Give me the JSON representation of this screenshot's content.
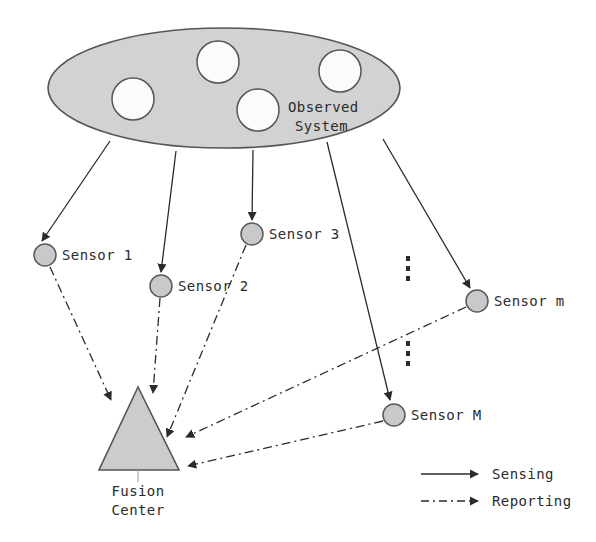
{
  "figure": {
    "title_region": {
      "label_line1": "Observed",
      "label_line2": "System",
      "fill": "#d2d2d2",
      "stroke": "#555555"
    },
    "sensors": [
      {
        "id": "sensor-1",
        "label": "Sensor 1",
        "cx": 45,
        "cy": 255,
        "r": 11,
        "label_x": 62,
        "label_y": 260
      },
      {
        "id": "sensor-2",
        "label": "Sensor 2",
        "cx": 161,
        "cy": 286,
        "r": 11,
        "label_x": 178,
        "label_y": 291
      },
      {
        "id": "sensor-3",
        "label": "Sensor 3",
        "cx": 252,
        "cy": 234,
        "r": 11,
        "label_x": 269,
        "label_y": 239
      },
      {
        "id": "sensor-m",
        "label": "Sensor m",
        "cx": 477,
        "cy": 301,
        "r": 11,
        "label_x": 494,
        "label_y": 306
      },
      {
        "id": "sensor-M",
        "label": "Sensor M",
        "cx": 394,
        "cy": 415,
        "r": 11,
        "label_x": 411,
        "label_y": 420
      }
    ],
    "ellipsis": [
      {
        "id": "ellipsis-upper",
        "x": 409,
        "y": 262
      },
      {
        "id": "ellipsis-lower",
        "x": 409,
        "y": 347
      }
    ],
    "fusion_center": {
      "label_line1": "Fusion",
      "label_line2": "Center",
      "fill": "#cccccc",
      "stroke": "#555555"
    },
    "legend": {
      "items": [
        {
          "id": "legend-sensing",
          "label": "Sensing",
          "style": "solid"
        },
        {
          "id": "legend-reporting",
          "label": "Reporting",
          "style": "dashdot"
        }
      ]
    },
    "colors": {
      "node_fill": "#c9c9c9",
      "node_stroke": "#5a5a5a",
      "line": "#2b2b2b",
      "background": "#ffffff"
    }
  }
}
